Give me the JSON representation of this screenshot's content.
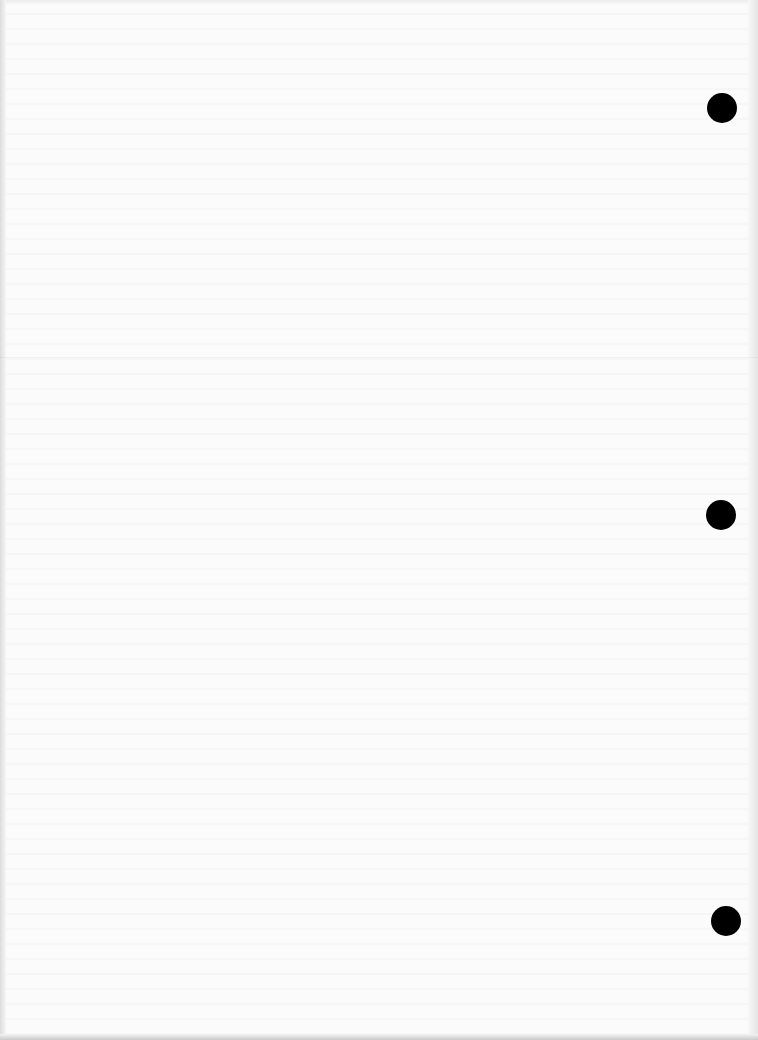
{
  "page": {
    "background": "#fbfbfb",
    "text_content": "",
    "fold_line_y": 357
  },
  "punch_holes": [
    {
      "cx": 722,
      "cy": 108,
      "r": 15,
      "color": "#000000"
    },
    {
      "cx": 721,
      "cy": 515,
      "r": 15,
      "color": "#000000"
    },
    {
      "cx": 726,
      "cy": 921,
      "r": 15,
      "color": "#000000"
    }
  ]
}
